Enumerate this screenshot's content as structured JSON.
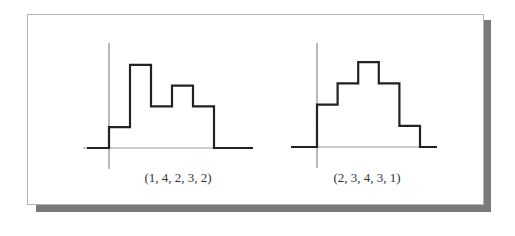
{
  "figure": {
    "panels": [
      {
        "label": "(1, 4, 2, 3, 2)"
      },
      {
        "label": "(2, 3, 4, 3, 1)"
      }
    ]
  },
  "chart_data": [
    {
      "type": "line",
      "subtype": "step",
      "title": "(1, 4, 2, 3, 2)",
      "x": [
        1,
        2,
        3,
        4,
        5
      ],
      "values": [
        1,
        4,
        2,
        3,
        2
      ],
      "xlabel": "",
      "ylabel": "",
      "grid": false
    },
    {
      "type": "line",
      "subtype": "step",
      "title": "(2, 3, 4, 3, 1)",
      "x": [
        1,
        2,
        3,
        4,
        5
      ],
      "values": [
        2,
        3,
        4,
        3,
        1
      ],
      "xlabel": "",
      "ylabel": "",
      "grid": false
    }
  ]
}
